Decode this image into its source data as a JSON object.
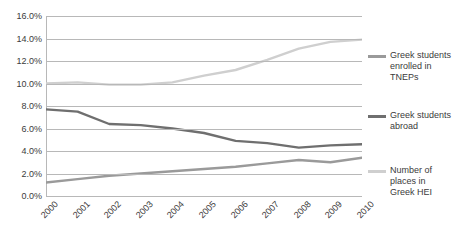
{
  "chart_data": {
    "type": "line",
    "title": "",
    "xlabel": "",
    "ylabel": "",
    "categories": [
      "2000",
      "2001",
      "2002",
      "2003",
      "2004",
      "2005",
      "2006",
      "2007",
      "2008",
      "2009",
      "2010"
    ],
    "ylim": [
      0,
      16
    ],
    "ytick_labels": [
      "0.0%",
      "2.0%",
      "4.0%",
      "6.0%",
      "8.0%",
      "10.0%",
      "12.0%",
      "14.0%",
      "16.0%"
    ],
    "ytick_values": [
      0,
      2,
      4,
      6,
      8,
      10,
      12,
      14,
      16
    ],
    "grid": true,
    "legend_position": "right",
    "series": [
      {
        "name": "Greek students enrolled in TNEPs",
        "color": "#9a9a9a",
        "values": [
          1.2,
          1.5,
          1.8,
          2.0,
          2.2,
          2.4,
          2.6,
          2.9,
          3.2,
          3.0,
          3.4
        ]
      },
      {
        "name": "Greek students abroad",
        "color": "#6f6f6f",
        "values": [
          7.7,
          7.5,
          6.4,
          6.3,
          6.0,
          5.6,
          4.9,
          4.7,
          4.3,
          4.5,
          4.6
        ]
      },
      {
        "name": "Number of places in Greek HEI",
        "color": "#cfcfcf",
        "values": [
          10.0,
          10.1,
          9.9,
          9.9,
          10.1,
          10.7,
          11.2,
          12.1,
          13.1,
          13.7,
          13.9
        ]
      }
    ]
  },
  "legend": {
    "entries": [
      {
        "label": "Greek students enrolled in TNEPs",
        "color": "#9a9a9a"
      },
      {
        "label": "Greek students abroad",
        "color": "#6f6f6f"
      },
      {
        "label": "Number of places in Greek HEI",
        "color": "#cfcfcf"
      }
    ]
  }
}
